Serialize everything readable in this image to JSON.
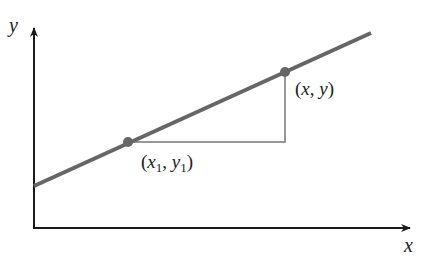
{
  "diagram": {
    "axes": {
      "x_label": "x",
      "y_label": "y",
      "color": "#1a1a1a"
    },
    "line": {
      "color": "#666666",
      "start": [
        34,
        186
      ],
      "end": [
        371,
        33
      ]
    },
    "points": [
      {
        "id": "p1",
        "label_open": "(",
        "label_x": "x",
        "label_sub1": "1",
        "label_comma": ", ",
        "label_y": "y",
        "label_sub2": "1",
        "label_close": ")",
        "pos": [
          128,
          142
        ]
      },
      {
        "id": "p2",
        "label": "(x, y)",
        "pos": [
          285,
          72
        ]
      }
    ],
    "guide_color": "#777777",
    "point_color": "#666666"
  }
}
